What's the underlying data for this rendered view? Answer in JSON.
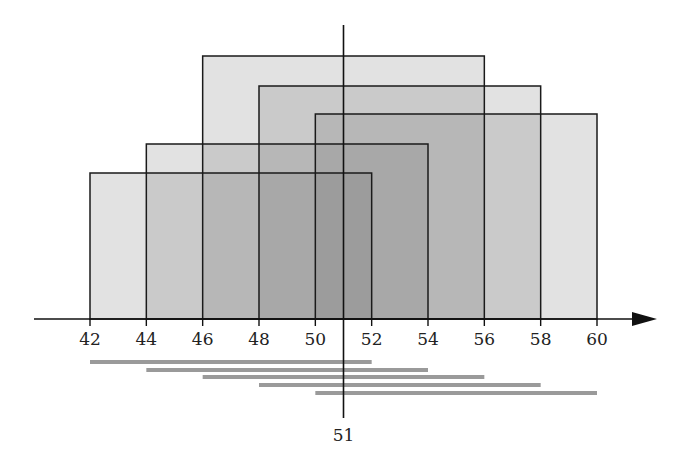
{
  "diagram": {
    "type": "overlapping-intervals",
    "axis": {
      "min": 42,
      "max": 60,
      "ticks": [
        42,
        44,
        46,
        48,
        50,
        52,
        54,
        56,
        58,
        60
      ],
      "tick_labels": [
        "42",
        "44",
        "46",
        "48",
        "50",
        "52",
        "54",
        "56",
        "58",
        "60"
      ]
    },
    "marker": {
      "value": 51,
      "label": "51"
    },
    "rectangles": [
      {
        "start": 42,
        "end": 52,
        "top_px": 173
      },
      {
        "start": 44,
        "end": 54,
        "top_px": 144
      },
      {
        "start": 46,
        "end": 56,
        "top_px": 56
      },
      {
        "start": 48,
        "end": 58,
        "top_px": 86
      },
      {
        "start": 50,
        "end": 60,
        "top_px": 114
      }
    ],
    "bars": [
      {
        "start": 42,
        "end": 52
      },
      {
        "start": 44,
        "end": 54
      },
      {
        "start": 46,
        "end": 56
      },
      {
        "start": 48,
        "end": 58
      },
      {
        "start": 50,
        "end": 60
      }
    ],
    "colors": {
      "rect_fill": "#6e6e6e",
      "rect_fill_opacity": 0.2,
      "stroke": "#1a1a1a",
      "bar": "#9a9a9a"
    }
  }
}
